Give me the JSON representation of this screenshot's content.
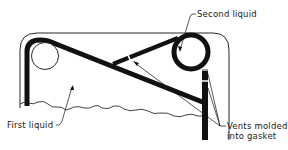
{
  "diagram": {
    "type": "cross-section",
    "labels": {
      "second_liquid": "Second liquid",
      "first_liquid": "First liquid",
      "vents_line1": "Vents molded",
      "vents_line2": "into gasket"
    },
    "colors": {
      "stroke": "#111111",
      "background": "#ffffff"
    }
  }
}
